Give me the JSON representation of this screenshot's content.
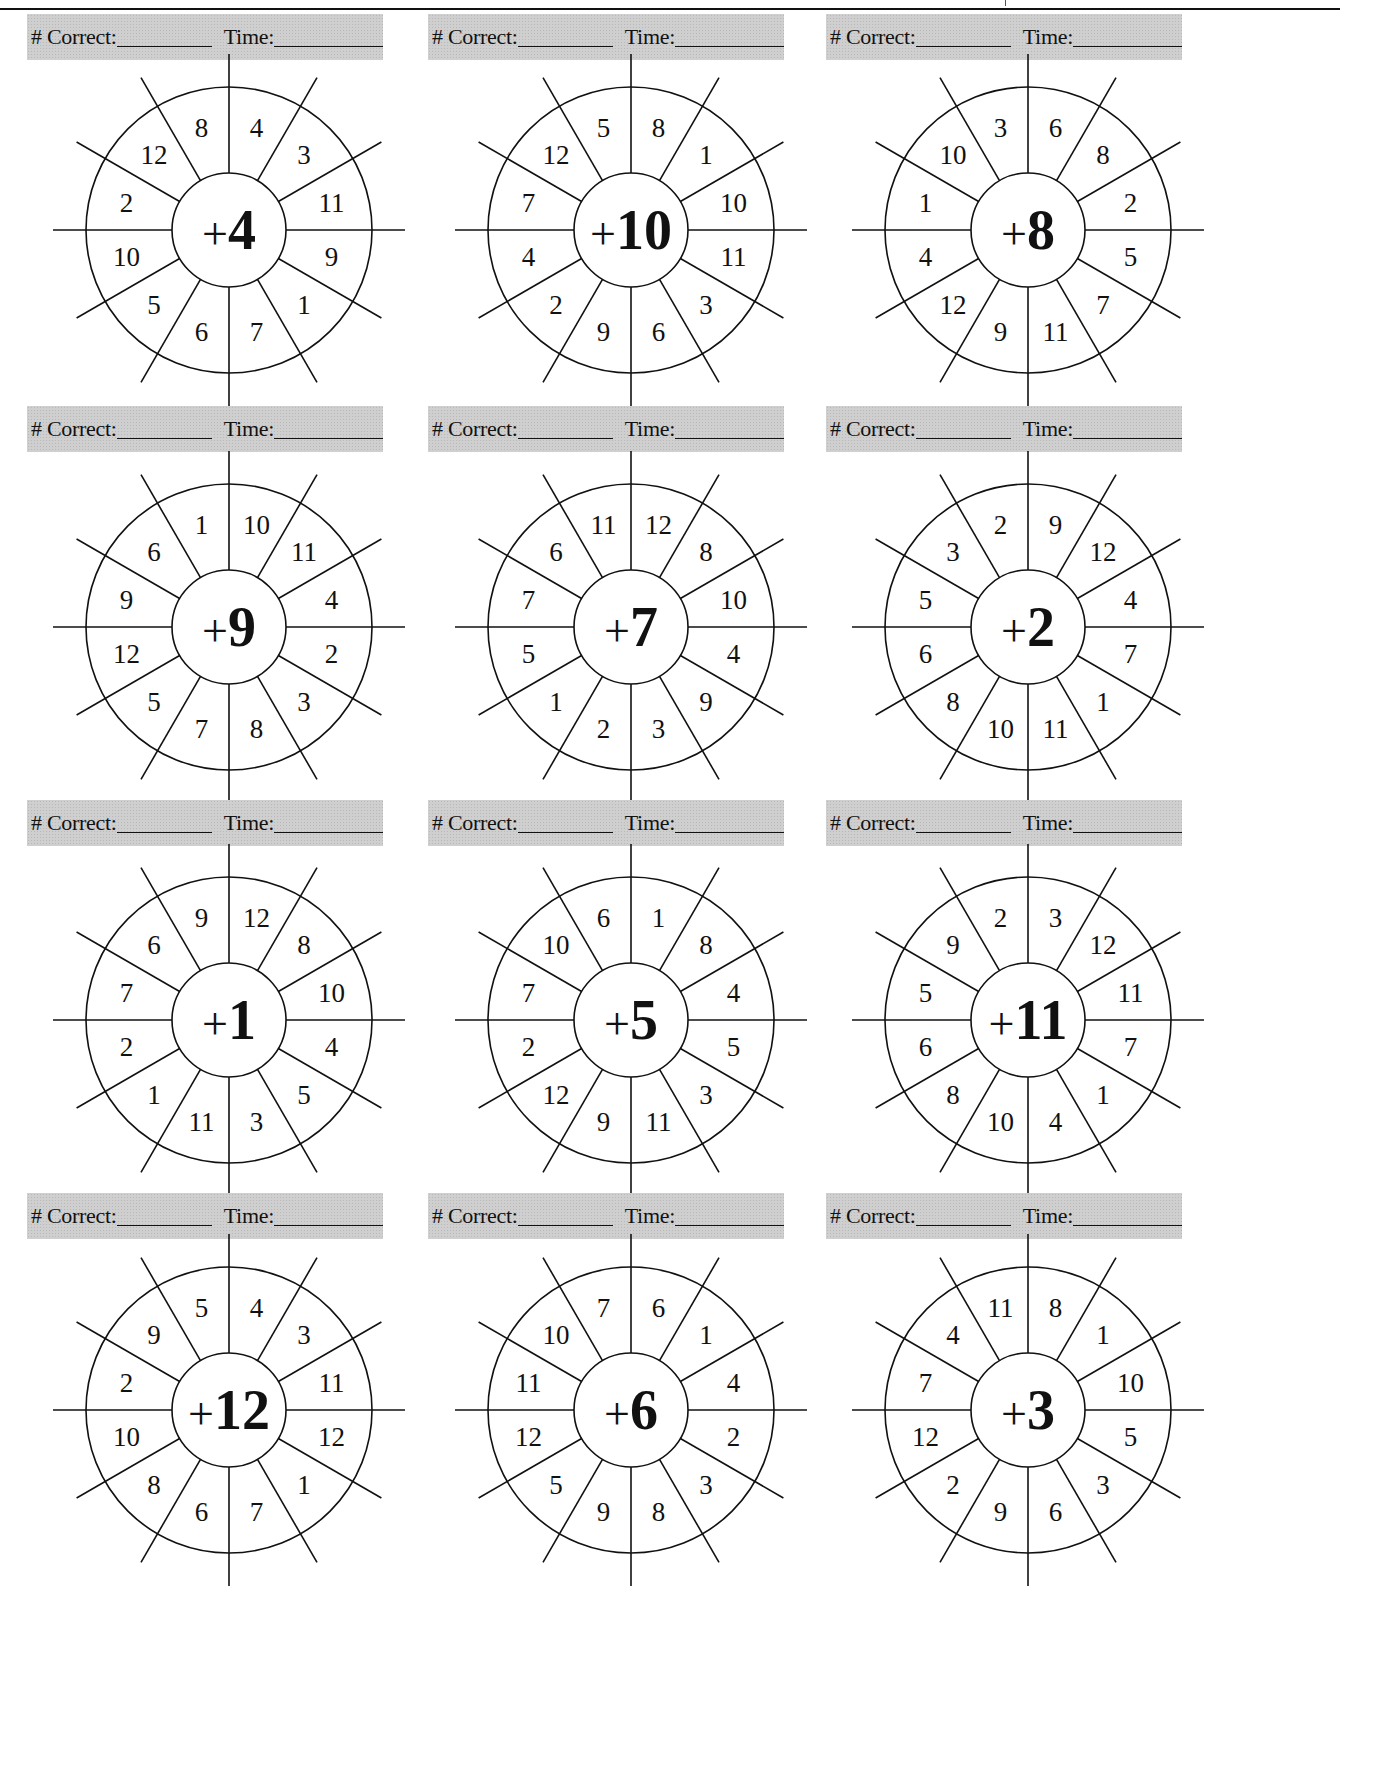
{
  "worksheet": {
    "header_labels": {
      "correct": "# Correct:",
      "time": "Time:"
    },
    "wheels": [
      {
        "operator": "+",
        "addend": "4",
        "numbers": [
          "4",
          "3",
          "11",
          "9",
          "1",
          "7",
          "6",
          "5",
          "10",
          "2",
          "12",
          "8"
        ]
      },
      {
        "operator": "+",
        "addend": "10",
        "numbers": [
          "8",
          "1",
          "10",
          "11",
          "3",
          "6",
          "9",
          "2",
          "4",
          "7",
          "12",
          "5"
        ]
      },
      {
        "operator": "+",
        "addend": "8",
        "numbers": [
          "6",
          "8",
          "2",
          "5",
          "7",
          "11",
          "9",
          "12",
          "4",
          "1",
          "10",
          "3"
        ]
      },
      {
        "operator": "+",
        "addend": "9",
        "numbers": [
          "10",
          "11",
          "4",
          "2",
          "3",
          "8",
          "7",
          "5",
          "12",
          "9",
          "6",
          "1"
        ]
      },
      {
        "operator": "+",
        "addend": "7",
        "numbers": [
          "12",
          "8",
          "10",
          "4",
          "9",
          "3",
          "2",
          "1",
          "5",
          "7",
          "6",
          "11"
        ]
      },
      {
        "operator": "+",
        "addend": "2",
        "numbers": [
          "9",
          "12",
          "4",
          "7",
          "1",
          "11",
          "10",
          "8",
          "6",
          "5",
          "3",
          "2"
        ]
      },
      {
        "operator": "+",
        "addend": "1",
        "numbers": [
          "12",
          "8",
          "10",
          "4",
          "5",
          "3",
          "11",
          "1",
          "2",
          "7",
          "6",
          "9"
        ]
      },
      {
        "operator": "+",
        "addend": "5",
        "numbers": [
          "1",
          "8",
          "4",
          "5",
          "3",
          "11",
          "9",
          "12",
          "2",
          "7",
          "10",
          "6"
        ]
      },
      {
        "operator": "+",
        "addend": "11",
        "numbers": [
          "3",
          "12",
          "11",
          "7",
          "1",
          "4",
          "10",
          "8",
          "6",
          "5",
          "9",
          "2"
        ]
      },
      {
        "operator": "+",
        "addend": "12",
        "numbers": [
          "4",
          "3",
          "11",
          "12",
          "1",
          "7",
          "6",
          "8",
          "10",
          "2",
          "9",
          "5"
        ]
      },
      {
        "operator": "+",
        "addend": "6",
        "numbers": [
          "6",
          "1",
          "4",
          "2",
          "3",
          "8",
          "9",
          "5",
          "12",
          "11",
          "10",
          "7"
        ]
      },
      {
        "operator": "+",
        "addend": "3",
        "numbers": [
          "8",
          "1",
          "10",
          "5",
          "3",
          "6",
          "9",
          "2",
          "12",
          "7",
          "4",
          "11"
        ]
      }
    ]
  },
  "colors": {
    "ink": "#111111",
    "header_gray": "#cfcfcf",
    "paper": "#ffffff"
  }
}
